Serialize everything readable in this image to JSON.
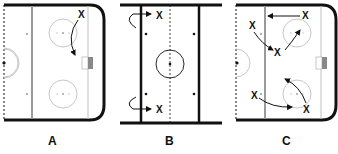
{
  "diagram": {
    "type": "hockey-drill",
    "panels": [
      {
        "id": "A",
        "label": "A",
        "view": "half-rink-offensive-zone",
        "players": [
          "X"
        ],
        "note": "one skater curls from top corner down toward the net"
      },
      {
        "id": "B",
        "label": "B",
        "view": "neutral-zone-vertical",
        "players": [
          "X",
          "X"
        ],
        "note": "two skaters turn back and skate into the zone"
      },
      {
        "id": "C",
        "label": "C",
        "view": "half-rink-offensive-zone",
        "players": [
          "X",
          "X",
          "X",
          "X",
          "X"
        ],
        "note": "multi-player passing/skating pattern"
      }
    ],
    "player_symbol": "X",
    "colors": {
      "boards": "#111111",
      "lines": "#9a9a9a",
      "circles": "#c8c8c8",
      "ink": "#111111"
    }
  },
  "labels": {
    "a": "A",
    "b": "B",
    "c": "C"
  }
}
